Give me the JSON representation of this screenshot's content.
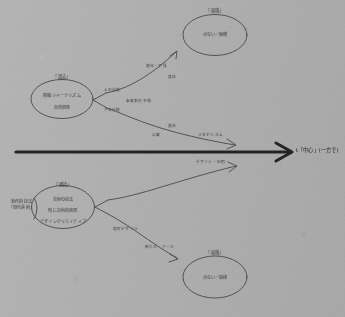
{
  "document": {
    "kind": "hand-drawn pencil diagram on gray paper",
    "medium": "pencil on gray paper",
    "language": "Japanese",
    "legibility": "handwriting is low-resolution and only partially legible"
  },
  "canvas": {
    "width": 345,
    "height": 317,
    "paper_color": "#b2b2b2",
    "ink_color": "#4a4a4a",
    "axis_ink_color": "#242424"
  },
  "axis": {
    "name": "time-axis",
    "label": "t「中心」(一方で)",
    "description": "thick horizontal arrow pointing right across the middle of the sheet"
  },
  "nodes": [
    {
      "id": "source-upper",
      "title": "「過去」",
      "lines": [
        "情報ジャーナリズム",
        "自然現象"
      ],
      "side_note": ""
    },
    {
      "id": "outcome-upper",
      "title": "「面積」",
      "lines": [
        "点ない／面積"
      ],
      "side_note": ""
    },
    {
      "id": "source-lower",
      "title": "「構造」",
      "lines": [
        "芸術の技法",
        "時に芸術的表現",
        "デザインクリエイティブ"
      ],
      "side_note": "制作的技法\n「現代美術」"
    },
    {
      "id": "outcome-lower",
      "title": "「面積」",
      "lines": [
        "点ない／曲線"
      ],
      "side_note": ""
    }
  ],
  "branch_labels": {
    "upper_fork_top": "上の分岐",
    "upper_fork_bottom": "下の分岐",
    "upper_fork_middle": "未来表の予測",
    "upper_rise_inner": "変化・予見",
    "upper_rise_outer": "変化",
    "upper_fall_inner": "変化",
    "upper_fall_outer": "公算",
    "upper_fall_arrow": "メタボリズム",
    "lower_rise_arrow": "デザイン・応用",
    "lower_fall_inner": "造形デザイン",
    "lower_fall_outer": "新たな・ケース"
  },
  "colors": {
    "paper": "#b2b2b2",
    "ink": "#4a4a4a",
    "axis_ink": "#242424"
  }
}
